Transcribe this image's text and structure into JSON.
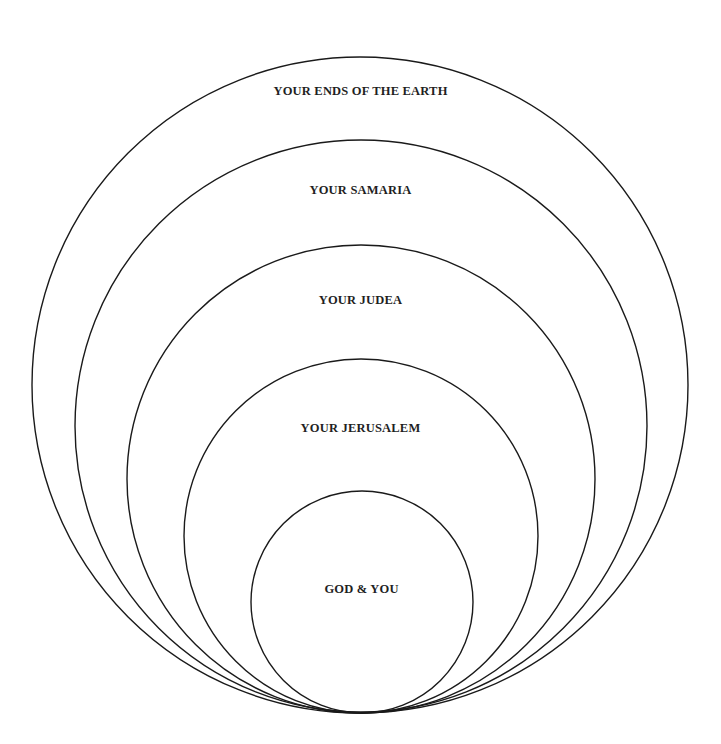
{
  "diagram": {
    "type": "nested-circles",
    "stroke_color": "#1a1a1a",
    "background": "#ffffff",
    "circles": [
      {
        "label": "YOUR ENDS OF THE EARTH",
        "cx": 360,
        "cy": 385,
        "r": 328,
        "label_y": 91
      },
      {
        "label": "YOUR SAMARIA",
        "cx": 361,
        "cy": 426,
        "r": 286,
        "label_y": 190
      },
      {
        "label": "YOUR JUDEA",
        "cx": 361,
        "cy": 479,
        "r": 234,
        "label_y": 300
      },
      {
        "label": "YOUR JERUSALEM",
        "cx": 361,
        "cy": 536,
        "r": 177,
        "label_y": 428
      },
      {
        "label": "GOD & YOU",
        "cx": 362,
        "cy": 602,
        "r": 111,
        "label_y": 589
      }
    ]
  }
}
